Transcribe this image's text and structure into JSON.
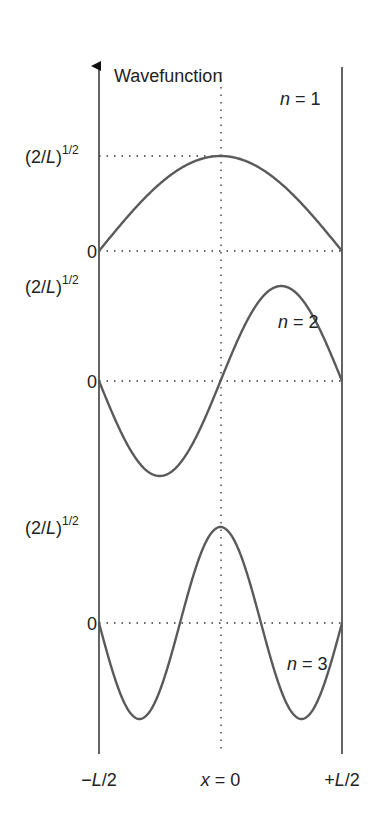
{
  "chart_data": {
    "type": "line",
    "title": "",
    "ylabel": "Wavefunction",
    "xlabel": "",
    "x_ticks": [
      {
        "value": -0.5,
        "label_prefix": "−",
        "label_var": "L",
        "label_suffix": "/2"
      },
      {
        "value": 0,
        "label_var": "x",
        "label_suffix": " = 0"
      },
      {
        "value": 0.5,
        "label_prefix": "+",
        "label_var": "L",
        "label_suffix": "/2"
      }
    ],
    "xlim": [
      -0.5,
      0.5
    ],
    "x_units": "L",
    "amplitude_label": {
      "open": "(2/",
      "var": "L",
      "close": ")",
      "sup": "1/2"
    },
    "zero_label": "0",
    "series": [
      {
        "name": "n = 1",
        "n": 1,
        "n_var": "n",
        "n_text": " = 1",
        "formula": "sqrt(2/L) cos(pi x / L)",
        "amplitude": 1
      },
      {
        "name": "n = 2",
        "n": 2,
        "n_var": "n",
        "n_text": " = 2",
        "formula": "sqrt(2/L) sin(2 pi x / L)",
        "amplitude": 1
      },
      {
        "name": "n = 3",
        "n": 3,
        "n_var": "n",
        "n_text": " = 3",
        "formula": "sqrt(2/L) cos(3 pi x / L)",
        "amplitude": 1
      }
    ],
    "colors": {
      "curve": "#5a5a5a",
      "axis": "#222222",
      "guide": "#333333"
    },
    "grid": false,
    "legend": "inline"
  }
}
